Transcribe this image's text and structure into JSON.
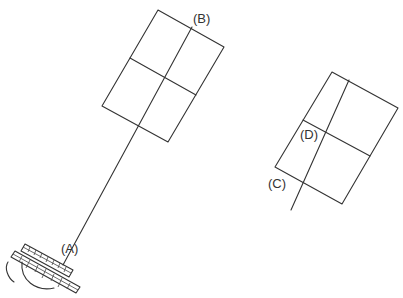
{
  "diagram": {
    "labels": {
      "A": "(A)",
      "B": "(B)",
      "C": "(C)",
      "D": "(D)"
    },
    "colors": {
      "line": "#333333",
      "background": "#ffffff"
    },
    "grid_1": {
      "corners": [
        [
          158,
          10
        ],
        [
          224,
          47
        ],
        [
          168,
          142
        ],
        [
          102,
          106
        ]
      ],
      "divider_line": [
        [
          192,
          28
        ],
        [
          63,
          265
        ]
      ]
    },
    "grid_2": {
      "corners": [
        [
          332,
          72
        ],
        [
          398,
          108
        ],
        [
          342,
          204
        ],
        [
          275,
          167
        ]
      ],
      "crossing_line": [
        [
          349,
          80
        ],
        [
          291,
          210
        ]
      ]
    }
  }
}
